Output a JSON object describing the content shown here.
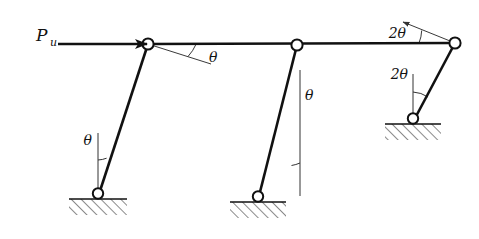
{
  "figure": {
    "name": "sway-frame-collapse-mechanism",
    "background_color": "#ffffff",
    "line_color": "#111111",
    "width": 479,
    "height": 239
  },
  "labels": {
    "force_symbol": "P",
    "force_subscript": "u",
    "angle_beam_left": "θ",
    "angle_column_left": "θ",
    "angle_column_middle": "θ",
    "angle_beam_right": "2θ",
    "angle_column_right": "2θ"
  },
  "geometry": {
    "joints": [
      {
        "name": "top-left-joint",
        "x": 148,
        "y": 44
      },
      {
        "name": "top-middle-joint",
        "x": 297,
        "y": 45
      },
      {
        "name": "top-right-joint",
        "x": 455,
        "y": 43
      },
      {
        "name": "base-left-pin",
        "x": 98,
        "y": 197
      },
      {
        "name": "base-middle-pin",
        "x": 258,
        "y": 200
      },
      {
        "name": "base-right-pin",
        "x": 413,
        "y": 122
      }
    ],
    "beam": {
      "x1": 148,
      "y1": 44,
      "x2": 455,
      "y2": 43
    },
    "columns": [
      {
        "name": "left-column",
        "x1": 148,
        "y1": 44,
        "x2": 98,
        "y2": 197
      },
      {
        "name": "middle-column",
        "x1": 297,
        "y1": 45,
        "x2": 258,
        "y2": 200
      },
      {
        "name": "right-column",
        "x1": 455,
        "y1": 43,
        "x2": 413,
        "y2": 122
      }
    ],
    "supports": [
      {
        "name": "left-support",
        "x": 98,
        "y": 199,
        "half_width": 29
      },
      {
        "name": "middle-support",
        "x": 258,
        "y": 202,
        "half_width": 28
      },
      {
        "name": "right-support",
        "x": 413,
        "y": 124,
        "half_width": 28
      }
    ],
    "force_arrow": {
      "x1": 58,
      "y1": 44,
      "x2": 146,
      "y2": 44
    },
    "reference_lines": [
      {
        "name": "beam-left-reference",
        "x1": 148,
        "y1": 44,
        "x2": 210,
        "y2": 63
      },
      {
        "name": "column-left-reference",
        "x1": 98,
        "y1": 197,
        "x2": 98,
        "y2": 132
      },
      {
        "name": "column-middle-reference",
        "x1": 258,
        "y1": 200,
        "x2": 300,
        "y2": 70
      },
      {
        "name": "beam-right-reference",
        "x1": 455,
        "y1": 43,
        "x2": 404,
        "y2": 23
      },
      {
        "name": "column-right-reference",
        "x1": 413,
        "y1": 122,
        "x2": 413,
        "y2": 74
      }
    ]
  }
}
